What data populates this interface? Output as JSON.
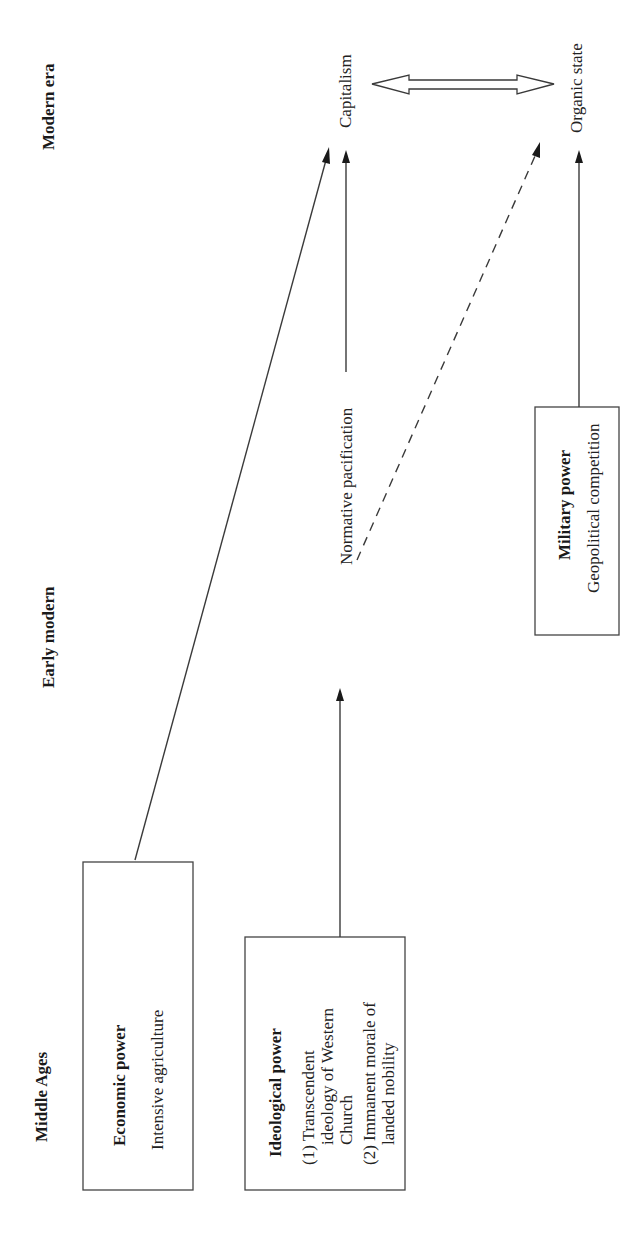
{
  "eras": {
    "modern": "Modern era",
    "early_modern": "Early modern",
    "middle_ages": "Middle Ages"
  },
  "boxes": {
    "economic": {
      "title": "Economic power",
      "lines": [
        "Intensive agriculture"
      ]
    },
    "ideological": {
      "title": "Ideological power",
      "lines": [
        "(1) Transcendent",
        "ideology of Western",
        "Church",
        "(2) Immanent morale of",
        "landed nobility"
      ]
    },
    "military": {
      "title": "Military power",
      "lines": [
        "Geopolitical competition"
      ]
    }
  },
  "nodes": {
    "normative_pacification": "Normative pacification",
    "capitalism": "Capitalism",
    "organic_state": "Organic state"
  },
  "edges": [
    {
      "from": "Economic power",
      "to": "Capitalism",
      "style": "solid"
    },
    {
      "from": "Ideological power",
      "to": "Normative pacification",
      "style": "solid"
    },
    {
      "from": "Normative pacification",
      "to": "Capitalism",
      "style": "solid"
    },
    {
      "from": "Normative pacification",
      "to": "Organic state",
      "style": "dashed"
    },
    {
      "from": "Military power",
      "to": "Organic state",
      "style": "solid"
    },
    {
      "from": "Capitalism",
      "to": "Organic state",
      "style": "double-headed-hollow"
    }
  ],
  "colors": {
    "background": "#ffffff",
    "ink": "#1a1a1a",
    "stroke": "#3a3a3a"
  }
}
